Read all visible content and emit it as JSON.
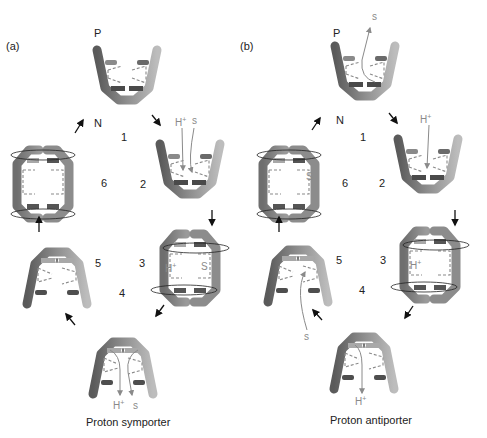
{
  "figure": {
    "panels": [
      {
        "id": "a",
        "label": "(a)",
        "caption": "Proton symporter",
        "membrane_labels": {
          "top": "P",
          "bottom": "N"
        },
        "states": [
          {
            "step": "1",
            "conformation": "open-outward (periplasm facing)",
            "substrates": []
          },
          {
            "step": "2",
            "conformation": "open-outward, binding",
            "substrates": [
              "H+",
              "S"
            ]
          },
          {
            "step": "3",
            "conformation": "occluded / rotating",
            "substrates": [
              "H+",
              "S"
            ]
          },
          {
            "step": "4",
            "conformation": "open-inward, release",
            "substrates": [
              "H+",
              "S"
            ]
          },
          {
            "step": "5",
            "conformation": "open-inward, empty",
            "substrates": []
          },
          {
            "step": "6",
            "conformation": "occluded / rotating, empty",
            "substrates": []
          }
        ]
      },
      {
        "id": "b",
        "label": "(b)",
        "caption": "Proton antiporter",
        "membrane_labels": {
          "top": "P",
          "bottom": "N"
        },
        "states": [
          {
            "step": "1",
            "conformation": "open-outward, S release",
            "substrates": [
              "S"
            ]
          },
          {
            "step": "2",
            "conformation": "open-outward, H+ binding",
            "substrates": [
              "H+"
            ]
          },
          {
            "step": "3",
            "conformation": "occluded / rotating",
            "substrates": [
              "H+"
            ]
          },
          {
            "step": "4",
            "conformation": "open-inward, H+ release",
            "substrates": [
              "H+"
            ]
          },
          {
            "step": "5",
            "conformation": "open-inward, S binding",
            "substrates": [
              "S"
            ]
          },
          {
            "step": "6",
            "conformation": "occluded / rotating",
            "substrates": [
              "S"
            ]
          }
        ]
      }
    ],
    "text": {
      "a_label": "(a)",
      "b_label": "(b)",
      "P": "P",
      "N": "N",
      "n1": "1",
      "n2": "2",
      "n3": "3",
      "n4": "4",
      "n5": "5",
      "n6": "6",
      "H": "H",
      "plus": "+",
      "S": "S",
      "s_lower": "s",
      "caption_a": "Proton symporter",
      "caption_b": "Proton antiporter"
    },
    "colors": {
      "helix_dark": "#5e5e5e",
      "helix_mid": "#8c8c8c",
      "helix_light": "#b5b5b5",
      "gate_dark": "#4a4a4a",
      "gate_light": "#a8a8a8",
      "dash": "#8a8a8a",
      "substrate_path": "#8a8a8a",
      "arrow": "#111111"
    }
  }
}
